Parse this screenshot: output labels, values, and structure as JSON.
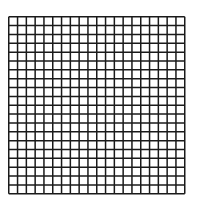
{
  "grid": {
    "rows": 20,
    "cols": 20,
    "left": 9,
    "top": 17,
    "width": 176,
    "height": 177,
    "line_color": "#1a1a1a",
    "line_width": 1.5,
    "background": "#ffffff"
  }
}
